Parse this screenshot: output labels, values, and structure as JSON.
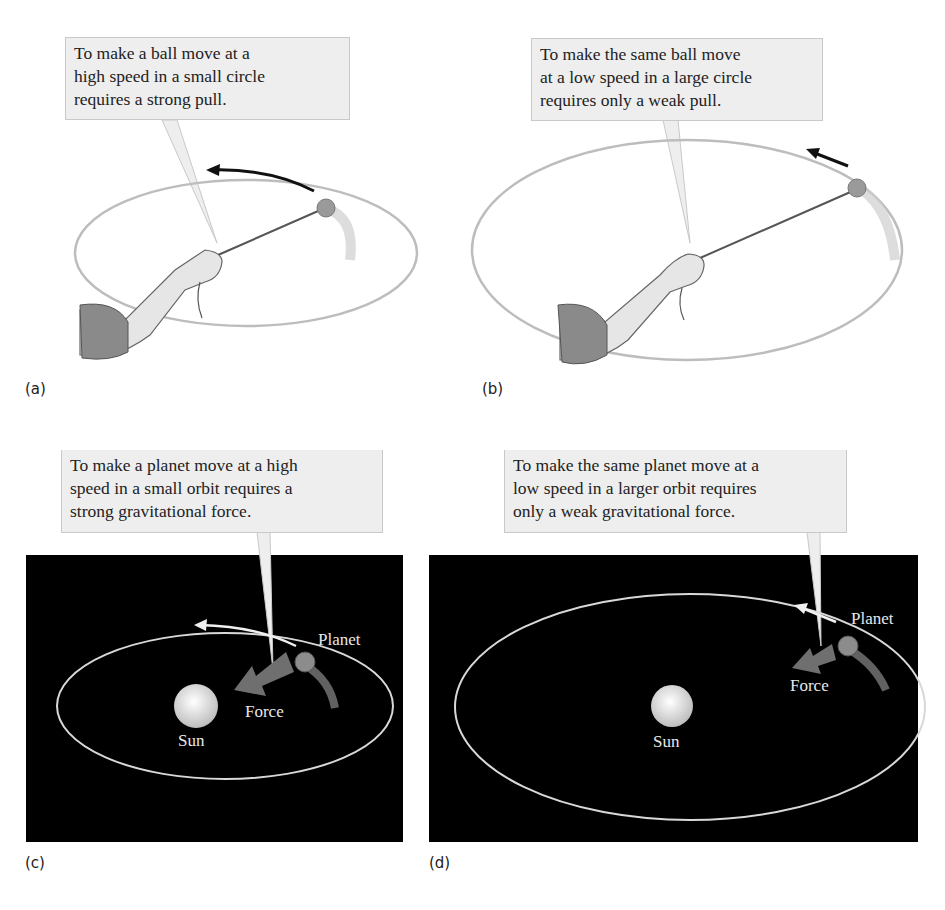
{
  "figure": {
    "panels": [
      {
        "id": "a",
        "label": "(a)",
        "callout": "To make a ball move at a\nhigh speed in a small circle\nrequires a strong pull.",
        "scene": "ball-on-string-small-circle"
      },
      {
        "id": "b",
        "label": "(b)",
        "callout": "To make the same ball move\nat a low speed in a large circle\nrequires only a weak pull.",
        "scene": "ball-on-string-large-circle"
      },
      {
        "id": "c",
        "label": "(c)",
        "callout": "To make a planet move at a high\nspeed in a small orbit requires a\nstrong gravitational force.",
        "scene": "planet-small-orbit",
        "sun_label": "Sun",
        "planet_label": "Planet",
        "force_label": "Force"
      },
      {
        "id": "d",
        "label": "(d)",
        "callout": "To make the same planet move at a\nlow speed in a larger orbit requires\nonly a weak gravitational force.",
        "scene": "planet-large-orbit",
        "sun_label": "Sun",
        "planet_label": "Planet",
        "force_label": "Force"
      }
    ],
    "colors": {
      "callout_bg": "#eeeeee",
      "space_bg": "#000000",
      "orbit": "#d8d8d8",
      "force_arrow": "#6f6f6f",
      "string_orbit": "#b5b5b5"
    }
  }
}
